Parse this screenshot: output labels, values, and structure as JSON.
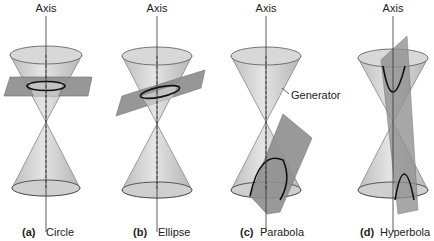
{
  "figure": {
    "panels": [
      {
        "id": "a",
        "letter": "(a)",
        "name": "Circle",
        "axis_label": "Axis"
      },
      {
        "id": "b",
        "letter": "(b)",
        "name": "Ellipse",
        "axis_label": "Axis"
      },
      {
        "id": "c",
        "letter": "(c)",
        "name": "Parabola",
        "axis_label": "Axis",
        "annotation": "Generator"
      },
      {
        "id": "d",
        "letter": "(d)",
        "name": "Hyperbola",
        "axis_label": "Axis"
      }
    ],
    "colors": {
      "cone": "#c8c8c8",
      "cone_edge": "#7a7a7a",
      "plane": "#8f8f8f",
      "curve": "#111111",
      "axis": "#333333"
    }
  }
}
